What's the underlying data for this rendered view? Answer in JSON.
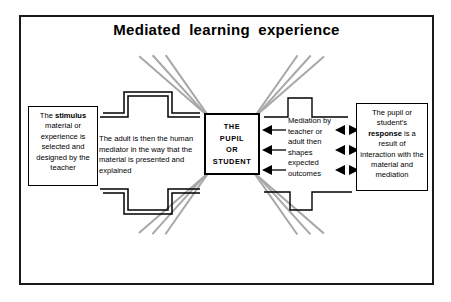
{
  "diagram": {
    "title": "Mediated  learning  experience",
    "frame_color": "#1a1a1a",
    "ray_color": "#a8a8a8",
    "line_color": "#000000",
    "background": "#ffffff"
  },
  "center_node": {
    "name": "the-pupil-or-student",
    "lines": [
      "THE",
      "PUPIL",
      "OR",
      "STUDENT"
    ]
  },
  "boxes": {
    "stimulus": {
      "label": "The stimulus material or experience is selected and designed by the teacher",
      "html": "The <b>stimulus</b> material or experience is selected and designed by the teacher"
    },
    "response": {
      "label": "The pupil or student's response is a result of interaction with the material and mediation",
      "html": "The pupil or student&rsquo;s <b>response</b> is a result of interaction with the material and mediation"
    }
  },
  "annotations": {
    "adult_mediator": "The adult is then the human mediator in the way that the material is presented and explained",
    "mediation_outcomes": "Mediation by teacher or adult then shapes expected outcomes"
  },
  "arrows": {
    "into_center_count": 3,
    "into_center_direction": "left",
    "bidirectional_pairs": 3,
    "bidirectional_direction": "outward"
  },
  "waveforms": {
    "top_left": "square-pulse-up-doubled",
    "bottom_left": "square-pulse-down-doubled",
    "top_right": "square-pulse-up",
    "bottom_right": "square-pulse-down"
  },
  "rays": {
    "top_left_count": 3,
    "top_right_count": 3,
    "bottom_left_count": 3,
    "bottom_right_count": 3
  }
}
